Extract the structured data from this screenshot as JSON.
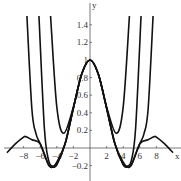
{
  "chart_data": {
    "type": "line",
    "title": "",
    "xlabel": "x",
    "ylabel": "y",
    "xlim": [
      -10,
      10.3
    ],
    "ylim": [
      -0.3,
      1.6
    ],
    "grid": false,
    "legend": null,
    "x_ticks": [
      -8,
      -6,
      -4,
      -2,
      2,
      4,
      6,
      8
    ],
    "x_tick_labels": [
      "−8",
      "−6",
      "−4",
      "−2",
      "2",
      "4",
      "6",
      "8"
    ],
    "y_ticks": [
      -0.2,
      0.2,
      0.4,
      0.6,
      0.8,
      1,
      1.2,
      1.4
    ],
    "y_tick_labels": [
      "−0.2",
      "0.2",
      "0.4",
      "0.6",
      "0.8",
      "1",
      "1.2",
      "1.4"
    ],
    "series": [
      {
        "name": "sin(x)/x",
        "x": [
          -10,
          -9,
          -8,
          -7.7,
          -7,
          -6,
          -5,
          -4.5,
          -4,
          -3,
          -2,
          -1,
          0,
          1,
          2,
          3,
          4,
          4.5,
          5,
          6,
          7,
          7.7,
          8,
          9,
          10
        ],
        "values": [
          -0.054,
          0.046,
          0.124,
          0.128,
          0.094,
          0.047,
          -0.192,
          -0.217,
          -0.189,
          0.047,
          0.455,
          0.841,
          1,
          0.841,
          0.455,
          0.047,
          -0.189,
          -0.217,
          -0.192,
          0.047,
          0.094,
          0.128,
          0.124,
          0.046,
          -0.054
        ]
      },
      {
        "name": "T4(x) = 1 − x²/6 + x⁴/120",
        "x": [
          -4.75,
          -4,
          -3.16,
          -2,
          -1,
          0,
          1,
          2,
          3.16,
          4,
          4.75
        ],
        "values": [
          1.5,
          0.467,
          0.167,
          0.467,
          0.842,
          1,
          0.842,
          0.467,
          0.167,
          0.467,
          1.5
        ]
      },
      {
        "name": "T8(x)",
        "x": [
          -6.15,
          -5.5,
          -5,
          -4.5,
          -4,
          -3,
          -2,
          -1,
          0,
          1,
          2,
          3,
          4,
          4.5,
          5,
          5.5,
          6.15
        ],
        "values": [
          1.5,
          0.23,
          -0.136,
          -0.206,
          -0.16,
          0.05,
          0.455,
          0.841,
          1,
          0.841,
          0.455,
          0.05,
          -0.16,
          -0.206,
          -0.136,
          0.23,
          1.5
        ]
      },
      {
        "name": "T12(x)",
        "x": [
          -7.6,
          -7,
          -6.5,
          -6,
          -5,
          -4.5,
          -4,
          -3,
          -2,
          -1,
          0,
          1,
          2,
          3,
          4,
          4.5,
          5,
          6,
          6.5,
          7,
          7.6
        ],
        "values": [
          1.5,
          0.44,
          0.16,
          0.05,
          -0.19,
          -0.217,
          -0.189,
          0.047,
          0.455,
          0.841,
          1,
          0.841,
          0.455,
          0.047,
          -0.189,
          -0.217,
          -0.19,
          0.05,
          0.16,
          0.44,
          1.5
        ]
      }
    ]
  }
}
